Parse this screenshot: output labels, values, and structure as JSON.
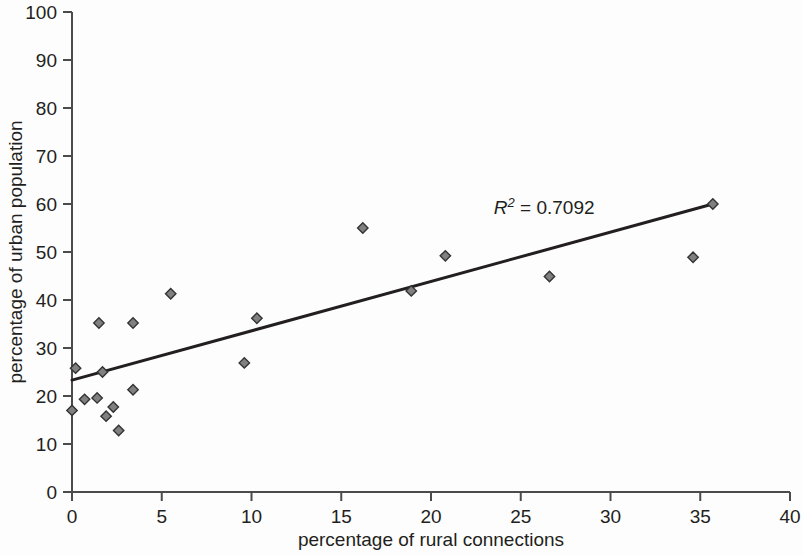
{
  "chart_data": {
    "type": "scatter",
    "title": "",
    "xlabel": "percentage of rural connections",
    "ylabel": "percentage of urban population",
    "xlim": [
      0,
      40
    ],
    "ylim": [
      0,
      100
    ],
    "xticks": [
      0,
      5,
      10,
      15,
      20,
      25,
      30,
      35,
      40
    ],
    "yticks": [
      0,
      10,
      20,
      30,
      40,
      50,
      60,
      70,
      80,
      90,
      100
    ],
    "xtick_labels": [
      "0",
      "5",
      "10",
      "15",
      "20",
      "25",
      "30",
      "35",
      "40"
    ],
    "ytick_labels": [
      "0",
      "10",
      "20",
      "30",
      "40",
      "50",
      "60",
      "70",
      "80",
      "90",
      "100"
    ],
    "grid": false,
    "legend": "none",
    "marker_shape": "diamond",
    "marker_color": "#808080",
    "marker_edge_color": "#333333",
    "points": [
      {
        "x": 0.0,
        "y": 17.0
      },
      {
        "x": 0.2,
        "y": 25.8
      },
      {
        "x": 0.7,
        "y": 19.3
      },
      {
        "x": 1.4,
        "y": 19.6
      },
      {
        "x": 1.5,
        "y": 35.2
      },
      {
        "x": 1.7,
        "y": 25.0
      },
      {
        "x": 1.9,
        "y": 15.8
      },
      {
        "x": 2.3,
        "y": 17.7
      },
      {
        "x": 2.6,
        "y": 12.8
      },
      {
        "x": 3.4,
        "y": 35.2
      },
      {
        "x": 3.4,
        "y": 21.3
      },
      {
        "x": 5.5,
        "y": 41.3
      },
      {
        "x": 9.6,
        "y": 26.9
      },
      {
        "x": 10.3,
        "y": 36.2
      },
      {
        "x": 16.2,
        "y": 55.0
      },
      {
        "x": 18.9,
        "y": 41.9
      },
      {
        "x": 20.8,
        "y": 49.2
      },
      {
        "x": 26.6,
        "y": 44.9
      },
      {
        "x": 34.6,
        "y": 48.9
      },
      {
        "x": 35.7,
        "y": 60.0
      }
    ],
    "trendline": {
      "type": "linear-fit",
      "x_start": 0.0,
      "y_start": 23.3,
      "x_end": 35.7,
      "y_end": 60.0,
      "color": "#231f20"
    },
    "annotations": [
      {
        "name": "r-squared",
        "prefix": "R",
        "superscript": "2",
        "suffix": " = 0.7092",
        "full_text": "R2 = 0.7092",
        "x": 23.5,
        "y": 58.0
      }
    ],
    "colors": {
      "axis": "#4b4b4b",
      "text": "#231f20",
      "background": "#fdfdfd",
      "marker_fill": "#808080",
      "trendline": "#231f20"
    }
  }
}
